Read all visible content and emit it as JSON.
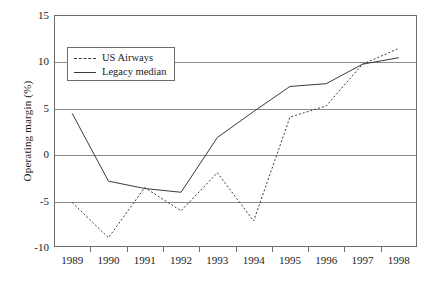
{
  "chart_data": {
    "type": "line",
    "title": "",
    "xlabel": "",
    "ylabel": "Operating margin (%)",
    "categories": [
      "1989",
      "1990",
      "1991",
      "1992",
      "1993",
      "1994",
      "1995",
      "1996",
      "1997",
      "1998"
    ],
    "ylim": [
      -10,
      15
    ],
    "y_ticks": [
      15,
      10,
      5,
      0,
      -5,
      -10
    ],
    "y_tick_labels": [
      "15",
      "10",
      "5",
      "0",
      "-5",
      "-10"
    ],
    "grid": true,
    "grid_axis": "y",
    "legend_position": "upper left inside",
    "series": [
      {
        "name": "US Airways",
        "style": "dashed",
        "color": "#3a3a3a",
        "values": [
          -5.2,
          -9.0,
          -3.6,
          -6.1,
          -2.0,
          -7.2,
          4.0,
          5.2,
          9.7,
          11.4
        ]
      },
      {
        "name": "Legacy median",
        "style": "solid",
        "color": "#3a3a3a",
        "values": [
          4.4,
          -2.9,
          -3.7,
          -4.1,
          1.8,
          4.6,
          7.3,
          7.6,
          9.7,
          10.4
        ]
      }
    ]
  },
  "legend": {
    "entries": [
      {
        "label": "US Airways",
        "style": "dashed"
      },
      {
        "label": "Legacy median",
        "style": "solid"
      }
    ]
  },
  "axes": {
    "y_title": "Operating margin (%)"
  },
  "colors": {
    "axis": "#6e6e6e",
    "grid": "#8a8a8a",
    "series": "#3a3a3a",
    "background": "#ffffff"
  }
}
